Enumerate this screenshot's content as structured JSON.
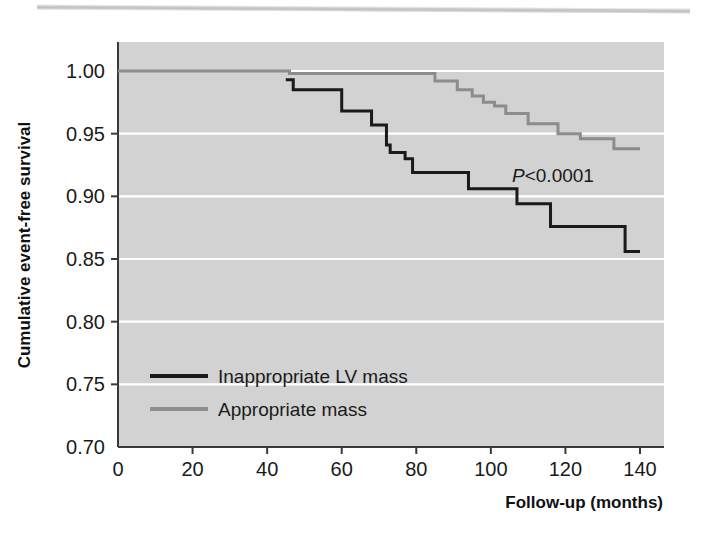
{
  "figure": {
    "background": "#ffffff",
    "plot_background": "#d2d2d2",
    "gridline_color": "#ffffff",
    "axis_color": "#3a3a3a"
  },
  "annotations": {
    "p_value_prefix": "P",
    "p_value_rest": "<0.0001"
  },
  "legend": {
    "items": [
      {
        "label": "Inappropriate LV mass",
        "color": "#1a1a1a"
      },
      {
        "label": "Appropriate mass",
        "color": "#8c8c8c"
      }
    ]
  },
  "chart_data": {
    "type": "line",
    "subtype": "kaplan-meier-step",
    "title": "",
    "xlabel": "Follow-up (months)",
    "ylabel": "Cumulative event-free survival",
    "xlim": [
      0,
      150
    ],
    "ylim": [
      0.7,
      1.005
    ],
    "xticks": [
      0,
      20,
      40,
      60,
      80,
      100,
      120,
      140
    ],
    "xticklabels": [
      "0",
      "20",
      "40",
      "60",
      "80",
      "100",
      "120",
      "140"
    ],
    "yticks": [
      0.7,
      0.75,
      0.8,
      0.85,
      0.9,
      0.95,
      1.0
    ],
    "yticklabels": [
      "0.70",
      "0.75",
      "0.80",
      "0.85",
      "0.90",
      "0.95",
      "1.00"
    ],
    "grid": "horizontal",
    "legend_position": "lower-left-inside",
    "annotation_text": "P<0.0001",
    "series": [
      {
        "name": "Inappropriate LV mass",
        "color": "#1a1a1a",
        "linewidth": 3,
        "x": [
          45,
          47,
          47,
          60,
          60,
          68,
          68,
          72,
          72,
          73,
          73,
          77,
          77,
          79,
          79,
          85,
          85,
          94,
          94,
          107,
          107,
          116,
          116,
          136,
          136,
          140
        ],
        "y": [
          0.993,
          0.993,
          0.985,
          0.985,
          0.968,
          0.968,
          0.957,
          0.957,
          0.941,
          0.941,
          0.935,
          0.935,
          0.93,
          0.93,
          0.919,
          0.919,
          0.919,
          0.919,
          0.906,
          0.906,
          0.894,
          0.894,
          0.876,
          0.876,
          0.856,
          0.856
        ],
        "step_points": [
          {
            "x": 45,
            "y": 0.993
          },
          {
            "x": 47,
            "y": 0.985
          },
          {
            "x": 60,
            "y": 0.968
          },
          {
            "x": 68,
            "y": 0.957
          },
          {
            "x": 72,
            "y": 0.941
          },
          {
            "x": 73,
            "y": 0.935
          },
          {
            "x": 77,
            "y": 0.93
          },
          {
            "x": 79,
            "y": 0.919
          },
          {
            "x": 94,
            "y": 0.906
          },
          {
            "x": 107,
            "y": 0.894
          },
          {
            "x": 116,
            "y": 0.876
          },
          {
            "x": 136,
            "y": 0.856
          },
          {
            "x": 140,
            "y": 0.856
          }
        ]
      },
      {
        "name": "Appropriate mass",
        "color": "#8c8c8c",
        "linewidth": 3,
        "x": [
          0,
          46,
          46,
          85,
          85,
          91,
          91,
          95,
          95,
          98,
          98,
          101,
          101,
          104,
          104,
          110,
          110,
          118,
          118,
          124,
          124,
          133,
          133,
          140
        ],
        "y": [
          1.0,
          1.0,
          0.998,
          0.998,
          0.992,
          0.992,
          0.985,
          0.985,
          0.98,
          0.98,
          0.975,
          0.975,
          0.972,
          0.972,
          0.966,
          0.966,
          0.958,
          0.958,
          0.95,
          0.95,
          0.946,
          0.946,
          0.938,
          0.938
        ],
        "step_points": [
          {
            "x": 0,
            "y": 1.0
          },
          {
            "x": 46,
            "y": 0.998
          },
          {
            "x": 85,
            "y": 0.992
          },
          {
            "x": 91,
            "y": 0.985
          },
          {
            "x": 95,
            "y": 0.98
          },
          {
            "x": 98,
            "y": 0.975
          },
          {
            "x": 101,
            "y": 0.972
          },
          {
            "x": 104,
            "y": 0.966
          },
          {
            "x": 110,
            "y": 0.958
          },
          {
            "x": 118,
            "y": 0.95
          },
          {
            "x": 124,
            "y": 0.946
          },
          {
            "x": 133,
            "y": 0.938
          },
          {
            "x": 140,
            "y": 0.938
          }
        ]
      }
    ]
  }
}
